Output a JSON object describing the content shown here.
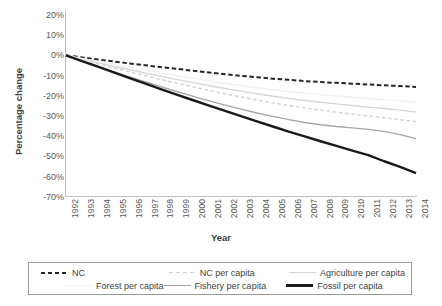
{
  "chart_data": {
    "type": "line",
    "title": "",
    "xlabel": "Year",
    "ylabel": "Percentage change",
    "grid": false,
    "legend_position": "bottom",
    "x": [
      1992,
      1993,
      1994,
      1995,
      1996,
      1997,
      1998,
      1999,
      2000,
      2001,
      2002,
      2003,
      2004,
      2005,
      2006,
      2007,
      2008,
      2009,
      2010,
      2011,
      2012,
      2013,
      2014
    ],
    "categories": [
      "1992",
      "1993",
      "1994",
      "1995",
      "1996",
      "1997",
      "1998",
      "1999",
      "2000",
      "2001",
      "2002",
      "2003",
      "2004",
      "2005",
      "2006",
      "2007",
      "2008",
      "2009",
      "2010",
      "2011",
      "2012",
      "2013",
      "2014"
    ],
    "ylim": [
      -70,
      20
    ],
    "yticks": [
      "20%",
      "10%",
      "0%",
      "-10%",
      "-20%",
      "-30%",
      "-40%",
      "-50%",
      "-60%",
      "-70%"
    ],
    "ytick_values": [
      20,
      10,
      0,
      -10,
      -20,
      -30,
      -40,
      -50,
      -60,
      -70
    ],
    "series": [
      {
        "name": "NC",
        "style": "dashed",
        "color": "#262626",
        "width": 2.0,
        "values": [
          0,
          -1.0,
          -2.0,
          -3.0,
          -4.0,
          -4.9,
          -5.8,
          -6.7,
          -7.6,
          -8.5,
          -9.3,
          -10.1,
          -10.8,
          -11.5,
          -12.1,
          -12.7,
          -13.2,
          -13.6,
          -14.0,
          -14.4,
          -14.8,
          -15.2,
          -15.6
        ]
      },
      {
        "name": "NC per capita",
        "style": "dashed",
        "color": "#d2d2d2",
        "width": 1.4,
        "values": [
          0,
          -2.1,
          -4.2,
          -6.2,
          -8.2,
          -10.1,
          -12.0,
          -13.8,
          -15.6,
          -17.3,
          -19.0,
          -20.6,
          -22.1,
          -23.5,
          -24.8,
          -26.0,
          -27.1,
          -28.1,
          -29.1,
          -30.0,
          -30.9,
          -31.8,
          -32.8
        ]
      },
      {
        "name": "Agriculture per capita",
        "style": "solid",
        "color": "#d6d6d6",
        "width": 1.4,
        "values": [
          0,
          -1.8,
          -3.6,
          -5.4,
          -7.1,
          -8.8,
          -10.4,
          -12.0,
          -13.5,
          -15.0,
          -16.4,
          -17.7,
          -19.0,
          -20.2,
          -21.3,
          -22.3,
          -23.2,
          -24.0,
          -24.8,
          -25.6,
          -26.3,
          -27.1,
          -28.0
        ]
      },
      {
        "name": "Forest per capita",
        "style": "solid",
        "color": "#f1f1f1",
        "width": 1.4,
        "values": [
          0,
          -1.5,
          -3.0,
          -4.5,
          -6.0,
          -7.4,
          -8.8,
          -10.1,
          -11.4,
          -12.6,
          -13.8,
          -14.9,
          -16.0,
          -17.0,
          -17.9,
          -18.7,
          -19.4,
          -20.1,
          -20.7,
          -21.3,
          -21.9,
          -22.5,
          -23.2
        ]
      },
      {
        "name": "Fishery per capita",
        "style": "solid",
        "color": "#a6a6a6",
        "width": 1.4,
        "values": [
          0,
          -2.7,
          -5.4,
          -8.0,
          -10.6,
          -13.1,
          -15.6,
          -18.0,
          -20.3,
          -22.5,
          -24.6,
          -26.6,
          -28.5,
          -30.2,
          -31.8,
          -33.2,
          -34.3,
          -35.2,
          -35.9,
          -36.6,
          -37.6,
          -39.2,
          -41.2
        ]
      },
      {
        "name": "Fossil per capita",
        "style": "solid",
        "color": "#1a1a1a",
        "width": 2.4,
        "values": [
          0,
          -2.8,
          -5.6,
          -8.4,
          -11.2,
          -14.0,
          -16.8,
          -19.5,
          -22.2,
          -24.9,
          -27.5,
          -30.1,
          -32.7,
          -35.2,
          -37.7,
          -40.1,
          -42.5,
          -44.8,
          -47.1,
          -49.4,
          -52.4,
          -55.2,
          -58.3
        ]
      }
    ]
  },
  "legend": {
    "items": [
      {
        "label": "NC",
        "swatch": "sw-nc"
      },
      {
        "label": "NC per capita",
        "swatch": "sw-ncpc"
      },
      {
        "label": "Agriculture per capita",
        "swatch": "sw-agri"
      },
      {
        "label": "Forest per capita",
        "swatch": "sw-forest"
      },
      {
        "label": "Fishery per capita",
        "swatch": "sw-fish"
      },
      {
        "label": "Fossil per capita",
        "swatch": "sw-fossil"
      }
    ]
  }
}
